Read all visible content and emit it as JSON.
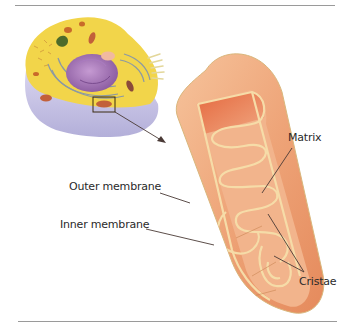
{
  "figure": {
    "labels": {
      "matrix": "Matrix",
      "outer_membrane": "Outer membrane",
      "inner_membrane": "Inner membrane",
      "cristae": "Cristae"
    },
    "colors": {
      "cell_cytoplasm": "#f2d54a",
      "cell_base": "#c9c6e6",
      "nucleus": "#9b6bb0",
      "mito_outer": "#eea478",
      "mito_inner_dark": "#e06a45",
      "membrane_edge": "#f6dca8",
      "leader_line": "#4a3a36",
      "rule": "#9a9a9a"
    }
  }
}
